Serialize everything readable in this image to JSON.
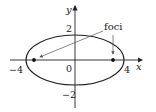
{
  "diagram": {
    "type": "ellipse-foci",
    "axes": {
      "x_label": "x",
      "y_label": "y"
    },
    "ticks": {
      "x_neg": "−4",
      "x_pos": "4",
      "origin": "0",
      "y_pos": "2",
      "y_neg": "−2"
    },
    "annotation": "foci",
    "ellipse": {
      "a": 4,
      "b": 2
    },
    "colors": {
      "stroke": "#222222",
      "arrow": "#555555",
      "background": "#ffffff"
    }
  }
}
